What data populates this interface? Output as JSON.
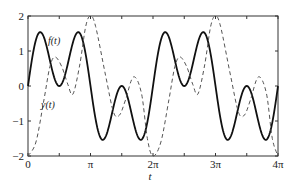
{
  "chart_data": {
    "type": "line",
    "title": "",
    "xlabel": "t",
    "ylabel": "",
    "xlim": [
      0,
      12.566
    ],
    "ylim": [
      -2,
      2
    ],
    "grid": false,
    "legend": "none (inline curve labels)",
    "x_ticks": [
      {
        "value": 0,
        "label": "0"
      },
      {
        "value": 3.1416,
        "label": "π"
      },
      {
        "value": 6.2832,
        "label": "2π"
      },
      {
        "value": 9.4248,
        "label": "3π"
      },
      {
        "value": 12.566,
        "label": "4π"
      }
    ],
    "y_ticks": [
      {
        "value": 2,
        "label": "2"
      },
      {
        "value": 1,
        "label": "1"
      },
      {
        "value": 0,
        "label": "0"
      },
      {
        "value": -1,
        "label": "−1"
      },
      {
        "value": -2,
        "label": "−2"
      }
    ],
    "series": [
      {
        "name": "f(t)",
        "style": "solid",
        "color": "#111111",
        "formula": "sin(t) + sin(3t)",
        "x": [
          0,
          0.52,
          1.05,
          1.57,
          2.09,
          2.62,
          3.14,
          3.67,
          4.19,
          4.71,
          5.24,
          5.76,
          6.28,
          6.81,
          7.33,
          7.85,
          8.38,
          8.9,
          9.42,
          9.95,
          10.47,
          11.0,
          11.52,
          12.04,
          12.57
        ],
        "y": [
          0,
          1.5,
          0.87,
          0,
          0.87,
          1.5,
          0,
          -1.5,
          -0.87,
          0,
          -0.87,
          -1.5,
          0,
          1.5,
          0.87,
          0,
          0.87,
          1.5,
          0,
          -1.5,
          -0.87,
          0,
          -0.87,
          -1.5,
          0
        ]
      },
      {
        "name": "y(t)",
        "style": "dashed",
        "color": "#555555",
        "x": [
          0,
          0.4,
          0.8,
          1.1,
          1.36,
          1.7,
          2.0,
          2.26,
          2.6,
          2.9,
          3.14,
          3.4,
          3.9,
          4.3,
          4.6,
          4.9,
          5.3,
          5.7,
          6.0,
          6.28,
          6.68,
          7.08,
          7.38,
          7.64,
          7.98,
          8.28,
          8.54,
          8.88,
          9.18,
          9.42,
          9.68,
          10.18,
          10.58,
          10.88,
          11.18,
          11.58,
          11.98,
          12.28,
          12.57
        ],
        "y": [
          -2,
          -1.6,
          -0.4,
          0.55,
          0.83,
          0.55,
          0.05,
          -0.23,
          0.6,
          1.7,
          2,
          1.7,
          0.3,
          -0.75,
          -0.83,
          -0.4,
          0.26,
          -0.2,
          -1.5,
          -2,
          -1.6,
          -0.4,
          0.55,
          0.83,
          0.55,
          0.05,
          -0.23,
          0.6,
          1.7,
          2,
          1.7,
          0.3,
          -0.75,
          -0.83,
          -0.4,
          0.26,
          -0.2,
          -1.5,
          -2
        ]
      }
    ],
    "annotations": [
      {
        "text": "f(t)",
        "x": 2.0,
        "y": 1.4
      },
      {
        "text": "y(t)",
        "x": 0.7,
        "y": -1.2
      }
    ]
  },
  "labels": {
    "f_label": "f(t)",
    "y_label": "y(t)",
    "x_axis_label": "t"
  }
}
